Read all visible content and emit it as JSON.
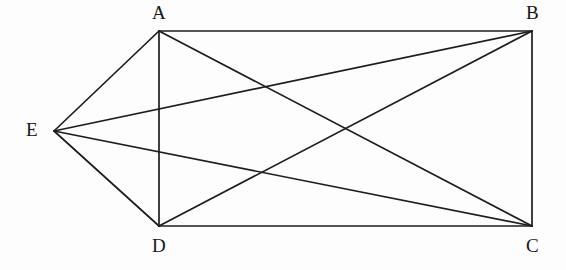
{
  "figure": {
    "kind": "geometry-diagram",
    "background_color": "#fdfdfd",
    "line_color": "#1d1d1d",
    "label_color": "#171717"
  },
  "chart_data": {
    "type": "diagram",
    "title": "",
    "xlabel": "",
    "ylabel": "",
    "coordinate_space": {
      "width": 566,
      "height": 270,
      "origin": "top-left",
      "units": "pixels"
    },
    "points": [
      {
        "id": "A",
        "label": "A",
        "x": 159,
        "y": 31,
        "label_x": 152,
        "label_y": 3,
        "label_position": "above"
      },
      {
        "id": "B",
        "label": "B",
        "x": 532,
        "y": 31,
        "label_x": 526,
        "label_y": 3,
        "label_position": "above"
      },
      {
        "id": "C",
        "label": "C",
        "x": 532,
        "y": 226,
        "label_x": 526,
        "label_y": 236,
        "label_position": "below"
      },
      {
        "id": "D",
        "label": "D",
        "x": 159,
        "y": 226,
        "label_x": 152,
        "label_y": 236,
        "label_position": "below"
      },
      {
        "id": "E",
        "label": "E",
        "x": 54,
        "y": 131,
        "label_x": 26,
        "label_y": 120,
        "label_position": "left"
      }
    ],
    "segments": [
      {
        "id": "AB",
        "from": "A",
        "to": "B",
        "role": "rectangle-edge"
      },
      {
        "id": "BC",
        "from": "B",
        "to": "C",
        "role": "rectangle-edge"
      },
      {
        "id": "CD",
        "from": "C",
        "to": "D",
        "role": "rectangle-edge"
      },
      {
        "id": "DA",
        "from": "D",
        "to": "A",
        "role": "rectangle-edge"
      },
      {
        "id": "AC",
        "from": "A",
        "to": "C",
        "role": "diagonal"
      },
      {
        "id": "BD",
        "from": "B",
        "to": "D",
        "role": "diagonal"
      },
      {
        "id": "EA",
        "from": "E",
        "to": "A",
        "role": "apex-connector"
      },
      {
        "id": "EB",
        "from": "E",
        "to": "B",
        "role": "apex-connector"
      },
      {
        "id": "EC",
        "from": "E",
        "to": "C",
        "role": "apex-connector"
      },
      {
        "id": "ED",
        "from": "E",
        "to": "D",
        "role": "apex-connector"
      }
    ],
    "intersections": [
      {
        "of": [
          "AC",
          "EB"
        ],
        "x": 265,
        "y": 86
      },
      {
        "of": [
          "BD",
          "EC"
        ],
        "x": 265,
        "y": 174
      },
      {
        "of": [
          "AC",
          "BD"
        ],
        "x": 345,
        "y": 129
      }
    ]
  }
}
